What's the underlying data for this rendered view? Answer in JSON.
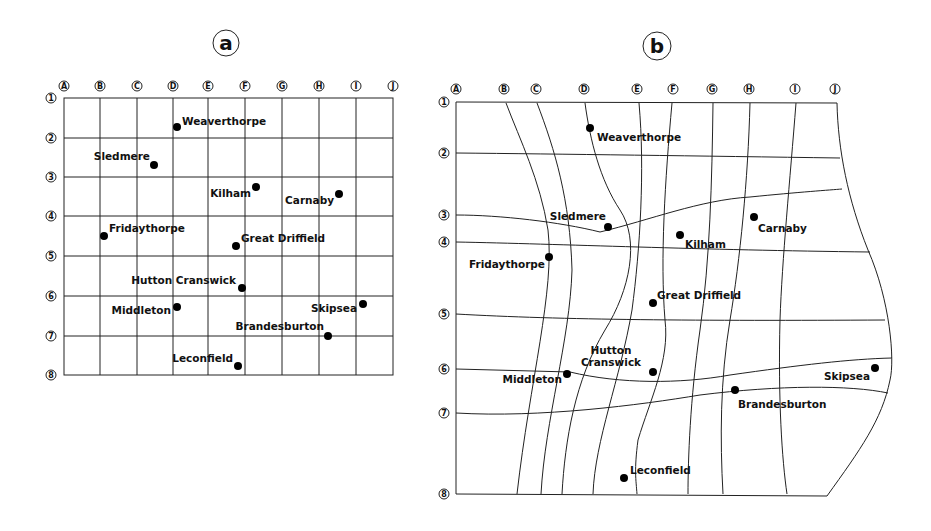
{
  "panels": {
    "a": {
      "title": "a",
      "columns": [
        "A",
        "B",
        "C",
        "D",
        "E",
        "F",
        "G",
        "H",
        "I",
        "J"
      ],
      "rows": [
        "1",
        "2",
        "3",
        "4",
        "5",
        "6",
        "7",
        "8"
      ],
      "towns": [
        {
          "name": "Weaverthorpe",
          "label": "Weaverthorpe"
        },
        {
          "name": "Sledmere",
          "label": "Sledmere"
        },
        {
          "name": "Kilham",
          "label": "Kilham"
        },
        {
          "name": "Carnaby",
          "label": "Carnaby"
        },
        {
          "name": "Fridaythorpe",
          "label": "Fridaythorpe"
        },
        {
          "name": "Great Driffield",
          "label": "Great Driffield"
        },
        {
          "name": "Hutton Cranswick",
          "label": "Hutton Cranswick"
        },
        {
          "name": "Middleton",
          "label": "Middleton"
        },
        {
          "name": "Skipsea",
          "label": "Skipsea"
        },
        {
          "name": "Brandesburton",
          "label": "Brandesburton"
        },
        {
          "name": "Leconfield",
          "label": "Leconfield"
        }
      ]
    },
    "b": {
      "title": "b",
      "columns": [
        "A",
        "B",
        "C",
        "D",
        "E",
        "F",
        "G",
        "H",
        "I",
        "J"
      ],
      "rows": [
        "1",
        "2",
        "3",
        "4",
        "5",
        "6",
        "7",
        "8"
      ],
      "towns": [
        {
          "name": "Weaverthorpe",
          "label": "Weaverthorpe"
        },
        {
          "name": "Sledmere",
          "label": "Sledmere"
        },
        {
          "name": "Kilham",
          "label": "Kilham"
        },
        {
          "name": "Carnaby",
          "label": "Carnaby"
        },
        {
          "name": "Fridaythorpe",
          "label": "Fridaythorpe"
        },
        {
          "name": "Great Driffield",
          "label": "Great Driffield"
        },
        {
          "name": "Hutton Cranswick",
          "label_line1": "Hutton",
          "label_line2": "Cranswick"
        },
        {
          "name": "Middleton",
          "label": "Middleton"
        },
        {
          "name": "Skipsea",
          "label": "Skipsea"
        },
        {
          "name": "Brandesburton",
          "label": "Brandesburton"
        },
        {
          "name": "Leconfield",
          "label": "Leconfield"
        }
      ]
    }
  }
}
